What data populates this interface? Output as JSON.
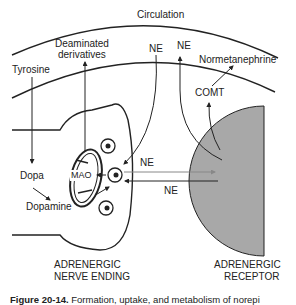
{
  "labels": {
    "circulation": "Circulation",
    "deaminated": "Deaminated",
    "derivatives": "derivatives",
    "ne_top_left": "NE",
    "ne_top_right": "NE",
    "normetanephrine": "Normetanephrine",
    "tyrosine": "Tyrosine",
    "comt": "COMT",
    "dopa": "Dopa",
    "mao": "MAO",
    "dopamine": "Dopamine",
    "ne_arrow_right": "NE",
    "ne_arrow_left": "NE",
    "nerve_ending_1": "ADRENERGIC",
    "nerve_ending_2": "NERVE ENDING",
    "receptor_1": "ADRENERGIC",
    "receptor_2": "RECEPTOR"
  },
  "caption": {
    "figure": "Figure 20-14.",
    "text": "Formation, uptake, and metabolism of norepi"
  },
  "colors": {
    "line": "#222222",
    "receptor_fill": "#a8a8a8",
    "arrow_gray": "#888888"
  }
}
